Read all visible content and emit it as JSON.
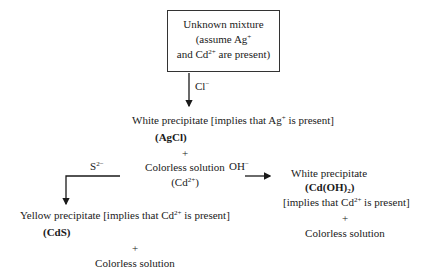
{
  "start_box": {
    "line1": "Unknown mixture",
    "line2_pre": "(assume Ag",
    "line2_sup": "+",
    "line3_pre": "and Cd",
    "line3_sup": "2+",
    "line3_post": " are present)"
  },
  "step1": {
    "reagent": "Cl",
    "reagent_sup": "−",
    "result_pre": "White precipitate [implies that Ag",
    "result_sup": "+",
    "result_post": " is present]",
    "formula": "(AgCl)",
    "plus": "+",
    "solution": "Colorless solution",
    "ion_pre": "(Cd",
    "ion_sup": "2+",
    "ion_post": ")"
  },
  "branch_left": {
    "reagent": "S",
    "reagent_sup": "2−",
    "result_pre": "Yellow precipitate [implies that Cd",
    "result_sup": "2+",
    "result_post": " is present]",
    "formula": "(CdS)",
    "plus": "+",
    "solution": "Colorless solution"
  },
  "branch_right": {
    "reagent": "OH",
    "reagent_sup": "−",
    "result": "White precipitate",
    "formula_pre": "(Cd(OH)",
    "formula_sub": "2",
    "formula_post": ")",
    "implies_pre": "[implies that Cd",
    "implies_sup": "2+",
    "implies_post": " is present]",
    "plus": "+",
    "solution": "Colorless solution"
  }
}
